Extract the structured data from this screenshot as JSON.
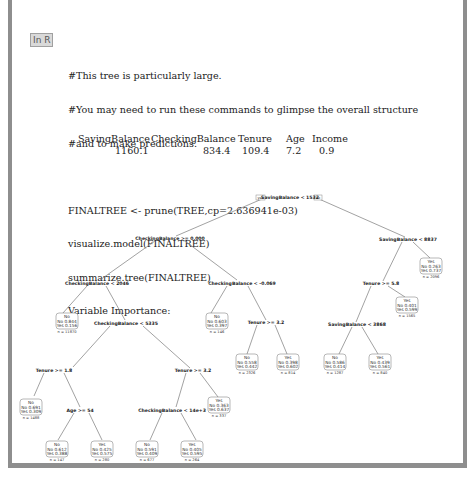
{
  "cell_label": "In R",
  "code_lines": {
    "comment1": "#This tree is particularly large.",
    "comment2": "#You may need to run these commands to glimpse the overall structure",
    "comment3": "#and to make predictions.",
    "cmd1": "FINALTREE <- prune(TREE,cp=2.636941e-03)",
    "cmd2": "visualize.model(FINALTREE)",
    "cmd3": "summarize.tree(FINALTREE)",
    "output_header": "Variable Importance:"
  },
  "variable_importance": {
    "headers": [
      "SavingBalance",
      "CheckingBalance",
      "Tenure",
      "Age",
      "Income"
    ],
    "values": [
      "1160.1",
      "834.4",
      "109.4",
      "7.2",
      "0.9"
    ]
  },
  "tree": {
    "root_yes_label": "yes",
    "root_no_label": "no",
    "splits": [
      {
        "id": "s1",
        "label": "SavingBalance < 1532"
      },
      {
        "id": "s2",
        "label": "CheckingBalance >= 0.000"
      },
      {
        "id": "s3",
        "label": "SavingBalance < 8837"
      },
      {
        "id": "s4",
        "label": "CheckingBalance < 2046"
      },
      {
        "id": "s5",
        "label": "CheckingBalance < -0.069"
      },
      {
        "id": "s6",
        "label": "Tenure >= 5.8"
      },
      {
        "id": "s7",
        "label": "CheckingBalance < 5335"
      },
      {
        "id": "s8",
        "label": "Tenure >= 3.2"
      },
      {
        "id": "s9",
        "label": "SavingBalance < 3868"
      },
      {
        "id": "s10",
        "label": "Tenure >= 1.8"
      },
      {
        "id": "s11",
        "label": "Tenure >= 3.2"
      },
      {
        "id": "s12",
        "label": "Age >= 54"
      },
      {
        "id": "s13",
        "label": "CheckingBalance < 14e+3"
      }
    ],
    "leaves": [
      {
        "id": "l1",
        "cls": "No",
        "no": "No 0.844",
        "yes": "Yes 0.156",
        "n": "n = 11870"
      },
      {
        "id": "l2",
        "cls": "No",
        "no": "No 0.603",
        "yes": "Yes 0.397",
        "n": "n = 146"
      },
      {
        "id": "l3",
        "cls": "Yes",
        "no": "No 0.263",
        "yes": "Yes 0.737",
        "n": "n = 2096"
      },
      {
        "id": "l4",
        "cls": "No",
        "no": "No 0.558",
        "yes": "Yes 0.442",
        "n": "n = 2326"
      },
      {
        "id": "l5",
        "cls": "Yes",
        "no": "No 0.398",
        "yes": "Yes 0.602",
        "n": "n = 814"
      },
      {
        "id": "l6",
        "cls": "Yes",
        "no": "No 0.401",
        "yes": "Yes 0.599",
        "n": "n = 1565"
      },
      {
        "id": "l7",
        "cls": "No",
        "no": "No 0.586",
        "yes": "Yes 0.414",
        "n": "n = 1287"
      },
      {
        "id": "l8",
        "cls": "Yes",
        "no": "No 0.439",
        "yes": "Yes 0.561",
        "n": "n = 840"
      },
      {
        "id": "l9",
        "cls": "No",
        "no": "No 0.691",
        "yes": "Yes 0.309",
        "n": "n = 1488"
      },
      {
        "id": "l10",
        "cls": "Yes",
        "no": "No 0.363",
        "yes": "Yes 0.637",
        "n": "n = 337"
      },
      {
        "id": "l11",
        "cls": "No",
        "no": "No 0.612",
        "yes": "Yes 0.388",
        "n": "n = 147"
      },
      {
        "id": "l12",
        "cls": "Yes",
        "no": "No 0.425",
        "yes": "Yes 0.575",
        "n": "n = 280"
      },
      {
        "id": "l13",
        "cls": "No",
        "no": "No 0.591",
        "yes": "Yes 0.409",
        "n": "n = 677"
      },
      {
        "id": "l14",
        "cls": "Yes",
        "no": "No 0.405",
        "yes": "Yes 0.595",
        "n": "n = 264"
      }
    ]
  }
}
